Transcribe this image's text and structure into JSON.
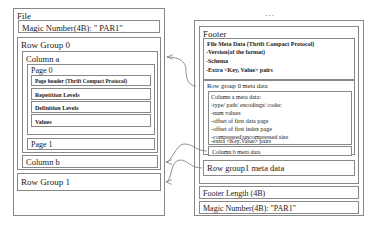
{
  "diagram": {
    "ellipsis": "..."
  },
  "file_panel": {
    "title": "File",
    "magic_number_top": "Magic Number(4B): \" PAR1\"",
    "row_group_0": {
      "label": "Row Group 0",
      "column_a": {
        "label": "Column a",
        "page_0": {
          "label": "Page 0",
          "page_header": "Page header (Thrift Compact Protocol)",
          "repetition_levels": "Repetition Levels",
          "definition_levels": "Definition Levels",
          "values": "Values"
        },
        "page_1": "Page 1"
      },
      "column_b": "Column b"
    },
    "row_group_1": "Row Group 1"
  },
  "footer_panel": {
    "title": "Footer",
    "file_meta_data": {
      "label": "File Meta Data (Thrift Compact Protocol)",
      "items": [
        "-Version(of the format)",
        "-Schema",
        "-Extra <Key, Value> pairs"
      ]
    },
    "row_group_0_meta": {
      "label": "Row group 0 meta data",
      "column_a_meta": {
        "title": "Column a meta data:",
        "items": [
          "-type/ path/ encodings/ codec",
          "-num values",
          "-offset of first data page",
          "-offset of first index page",
          "-compressed\\uncompressed size",
          "-extra <Key,Value> pairs"
        ]
      },
      "column_b_meta": "Column b meta data"
    },
    "row_group_1_meta": "Row group1 meta data",
    "footer_length": "Footer Length (4B)",
    "magic_number_bottom": "Magic Number(4B): \"PAR1\""
  },
  "colors": {
    "stroke": "#888888",
    "text": "#1a1a1a",
    "background": "#ffffff"
  }
}
